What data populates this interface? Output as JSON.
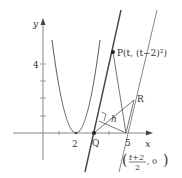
{
  "diagram": {
    "type": "coordinate-geometry",
    "curve": "y = (x-2)^2",
    "axes": {
      "x_label": "x",
      "y_label": "y",
      "x_ticks": [
        "2",
        "5"
      ],
      "y_ticks": [
        "4"
      ]
    },
    "points": {
      "P": {
        "label": "P(t, (t−2)²)",
        "name": "P",
        "coords_text": "(t, (t−2)²)"
      },
      "Q": {
        "label": "Q"
      },
      "R": {
        "label": "R"
      },
      "midpoint": {
        "label_num": "t+2",
        "label_den": "2",
        "label_rest": ", 0"
      }
    },
    "distance_label": "h",
    "colors": {
      "line": "#555555",
      "axis": "#777777",
      "curve": "#666666",
      "text": "#333333"
    }
  }
}
